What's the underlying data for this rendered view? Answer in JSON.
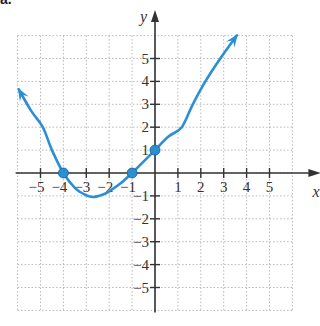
{
  "corner_label": "a.",
  "chart_data": {
    "type": "line",
    "title": "",
    "xlabel": "x",
    "ylabel": "y",
    "xlim": [
      -6,
      6
    ],
    "ylim": [
      -6,
      6
    ],
    "grid": true,
    "grid_style": "dotted",
    "x_ticks": [
      -5,
      -4,
      -3,
      -2,
      -1,
      1,
      2,
      3,
      4,
      5
    ],
    "y_ticks": [
      -5,
      -4,
      -3,
      -2,
      -1,
      1,
      2,
      3,
      4,
      5
    ],
    "x_tick_labels": [
      "−5",
      "−4",
      "−3",
      "−2",
      "−1",
      "1",
      "2",
      "3",
      "4",
      "5"
    ],
    "y_tick_labels": [
      "−5",
      "−4",
      "−3",
      "−2",
      "−1",
      "1",
      "2",
      "3",
      "4",
      "5"
    ],
    "series": [
      {
        "name": "curve",
        "color": "#2b8fd4",
        "arrows": [
          "start",
          "end"
        ],
        "points": [
          [
            -5.95,
            3.65
          ],
          [
            -5.4,
            2.7
          ],
          [
            -4.9,
            2.0
          ],
          [
            -4.5,
            1.0
          ],
          [
            -4.0,
            0.0
          ],
          [
            -3.5,
            -0.65
          ],
          [
            -3.0,
            -0.98
          ],
          [
            -2.7,
            -1.05
          ],
          [
            -2.3,
            -0.95
          ],
          [
            -2.0,
            -0.8
          ],
          [
            -1.5,
            -0.45
          ],
          [
            -1.0,
            0.0
          ],
          [
            -0.5,
            0.5
          ],
          [
            0.0,
            1.0
          ],
          [
            0.6,
            1.6
          ],
          [
            1.17,
            2.0
          ],
          [
            1.65,
            3.0
          ],
          [
            2.2,
            4.0
          ],
          [
            2.85,
            5.0
          ],
          [
            3.57,
            6.0
          ]
        ]
      }
    ],
    "marked_points": [
      [
        -4,
        0
      ],
      [
        -1,
        0
      ],
      [
        0,
        1
      ]
    ],
    "axis_color": "#333333",
    "grid_color": "#b8b8b8"
  }
}
